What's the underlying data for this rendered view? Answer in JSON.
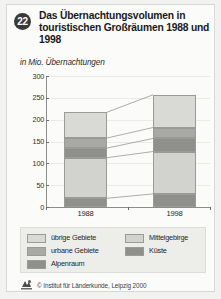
{
  "header": {
    "badge": "22",
    "title": "Das Übernachtungsvolumen in touristischen Großräumen 1988 und 1998",
    "subtitle": "in Mio. Übernachtungen"
  },
  "footer": {
    "credit": "© Institut für Länderkunde, Leipzig 2000",
    "logo_icon": "ifl-logo-icon"
  },
  "legend": {
    "items": [
      {
        "label": "übrige Gebiete",
        "color": "#d9d9d6"
      },
      {
        "label": "Mittelgebirge",
        "color": "#d2d2cf"
      },
      {
        "label": "urbane Gebiete",
        "color": "#a8a8a4"
      },
      {
        "label": "Küste",
        "color": "#8f8f8b"
      },
      {
        "label": "Alpenraum",
        "color": "#8f8f8b"
      }
    ]
  },
  "chart_data": {
    "type": "bar",
    "title": "Das Übernachtungsvolumen in touristischen Großräumen 1988 und 1998",
    "subtitle": "in Mio. Übernachtungen",
    "xlabel": "",
    "ylabel": "in Mio. Übernachtungen",
    "ylim": [
      0,
      300
    ],
    "yticks": [
      0,
      50,
      100,
      150,
      200,
      250,
      300
    ],
    "grid": true,
    "stacked": true,
    "legend_position": "bottom",
    "categories": [
      "1988",
      "1998"
    ],
    "series": [
      {
        "name": "Alpenraum",
        "values": [
          20,
          30
        ],
        "color": "#8f8f8b"
      },
      {
        "name": "Mittelgebirge",
        "values": [
          93,
          97
        ],
        "color": "#d2d2cf"
      },
      {
        "name": "Küste",
        "values": [
          22,
          30
        ],
        "color": "#8f8f8b"
      },
      {
        "name": "urbane Gebiete",
        "values": [
          23,
          25
        ],
        "color": "#a8a8a4"
      },
      {
        "name": "übrige Gebiete",
        "values": [
          59,
          75
        ],
        "color": "#d9d9d6"
      }
    ],
    "cumulative_tops": {
      "1988": [
        20,
        113,
        135,
        158,
        217
      ],
      "1998": [
        30,
        127,
        157,
        182,
        257
      ]
    },
    "totals": [
      217,
      257
    ]
  }
}
